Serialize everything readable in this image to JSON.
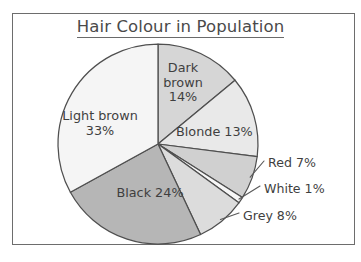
{
  "chart_data": {
    "type": "pie",
    "title": "Hair Colour in Population",
    "xlabel": "",
    "ylabel": "",
    "legend_position": "none",
    "grid": false,
    "value_unit": "percent",
    "categories": [
      "Dark brown",
      "Blonde",
      "Red",
      "White",
      "Grey",
      "Black",
      "Light brown"
    ],
    "values": [
      14,
      13,
      7,
      1,
      8,
      24,
      33
    ],
    "slices": [
      {
        "name": "dark-brown",
        "label": "Dark\nbrown\n14%",
        "category": "Dark brown",
        "value": 14,
        "value_text": "14%",
        "color": "#d6d6d6",
        "start_angle_deg": 0,
        "end_angle_deg": 50.4,
        "label_style": "inside"
      },
      {
        "name": "blonde",
        "label": "Blonde 13%",
        "category": "Blonde",
        "value": 13,
        "value_text": "13%",
        "color": "#e9e9e9",
        "start_angle_deg": 50.4,
        "end_angle_deg": 97.2,
        "label_style": "inside"
      },
      {
        "name": "red",
        "label": "Red 7%",
        "category": "Red",
        "value": 7,
        "value_text": "7%",
        "color": "#d0d0d0",
        "start_angle_deg": 97.2,
        "end_angle_deg": 122.4,
        "label_style": "callout"
      },
      {
        "name": "white",
        "label": "White 1%",
        "category": "White",
        "value": 1,
        "value_text": "1%",
        "color": "#f6f6f6",
        "start_angle_deg": 122.4,
        "end_angle_deg": 126.0,
        "label_style": "callout"
      },
      {
        "name": "grey",
        "label": "Grey 8%",
        "category": "Grey",
        "value": 8,
        "value_text": "8%",
        "color": "#dcdcdc",
        "start_angle_deg": 126.0,
        "end_angle_deg": 154.8,
        "label_style": "callout"
      },
      {
        "name": "black",
        "label": "Black 24%",
        "category": "Black",
        "value": 24,
        "value_text": "24%",
        "color": "#b6b6b6",
        "start_angle_deg": 154.8,
        "end_angle_deg": 241.2,
        "label_style": "inside"
      },
      {
        "name": "light-brown",
        "label": "Light brown\n33%",
        "category": "Light brown",
        "value": 33,
        "value_text": "33%",
        "color": "#f5f5f5",
        "start_angle_deg": 241.2,
        "end_angle_deg": 360,
        "label_style": "inside"
      }
    ],
    "total": 100,
    "geometry": {
      "center_x": 158,
      "center_y": 144,
      "radius": 100,
      "start_at_twelve_oclock": true,
      "direction": "clockwise"
    }
  },
  "style": {
    "frame_color": "#6d6d6d",
    "outline_color": "#4f4f4f",
    "text_color": "#3f3f3f",
    "background": "#ffffff"
  }
}
